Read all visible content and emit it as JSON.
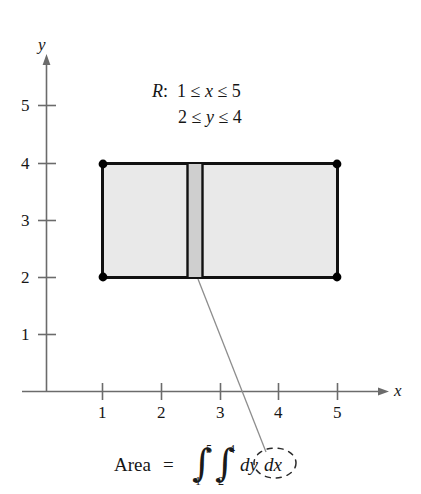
{
  "figure": {
    "title_region": {
      "line1": "R:  1 ≤ x ≤ 5",
      "line2": "2 ≤ y ≤ 4",
      "region_symbol": "R",
      "x_lower": 1,
      "x_upper": 5,
      "y_lower": 2,
      "y_upper": 4
    },
    "axes": {
      "x_label": "x",
      "y_label": "y",
      "x_ticks": [
        "1",
        "2",
        "3",
        "4",
        "5"
      ],
      "y_ticks": [
        "1",
        "2",
        "3",
        "4",
        "5"
      ],
      "x_tick_values": [
        1,
        2,
        3,
        4,
        5
      ],
      "y_tick_values": [
        1,
        2,
        3,
        4,
        5
      ],
      "origin_shown": false
    },
    "rectangle": {
      "x_min": 1,
      "x_max": 5,
      "y_min": 2,
      "y_max": 4,
      "fill_color": "#e9e9e9",
      "edge_color": "#000000",
      "corner_markers": 4
    },
    "strip": {
      "label": "dx",
      "x_start": 2.45,
      "x_end": 2.72,
      "y_min": 2,
      "y_max": 4,
      "fill_color": "#cfcfcf"
    },
    "formula": {
      "area_label": "Area",
      "equals": "=",
      "integral_symbol": "∫",
      "outer_lower": "1",
      "outer_upper": "5",
      "inner_lower": "2",
      "inner_upper": "4",
      "differential_inner": "dy",
      "differential_outer": "dx",
      "full_text": "Area = ∫₁⁵ ∫₂⁴ dy dx",
      "highlight": "dx"
    },
    "colors": {
      "background": "#ffffff",
      "axis": "#6b6b6b",
      "ink": "#161616",
      "leader_line": "#8a8a8a"
    }
  }
}
